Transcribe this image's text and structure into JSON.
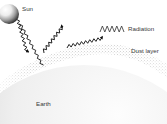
{
  "figure": {
    "background_color": "#ffffff",
    "width": 167,
    "height": 124
  },
  "labels": {
    "sun": "Sun",
    "radiation": "Radiation",
    "dust_layer": "Dust layer",
    "earth": "Earth"
  },
  "legend": {
    "symbol_name": "zigzag-wave-icon",
    "symbol_text": "WWWW",
    "entry_label": "Radiation"
  },
  "colors": {
    "text": "#3a3a3a",
    "ray": "#1a1a1a",
    "sun_light": "#f2f2f2",
    "sun_dark": "#2b2b2b",
    "earth_light": "#fbfbfb",
    "earth_dark": "#b9b9b9",
    "dust": "#9a9a9a"
  },
  "elements": {
    "sun": {
      "name": "sun-sphere",
      "cx": 9,
      "cy": 14,
      "r": 10
    },
    "earth": {
      "name": "earth-sphere",
      "cx": 84,
      "cy": 205,
      "r": 140
    },
    "dust_layer": {
      "name": "dust-layer-band",
      "description": "stippled arc band above earth"
    }
  },
  "rays": [
    {
      "name": "incoming-ray-1",
      "from": [
        16,
        20
      ],
      "to": [
        42,
        54
      ],
      "arrow": "end",
      "direction": "down-right"
    },
    {
      "name": "incoming-ray-2",
      "from": [
        20,
        27
      ],
      "to": [
        66,
        49
      ],
      "arrow": "none",
      "direction": "down-right"
    },
    {
      "name": "outgoing-ray-1",
      "from": [
        44,
        52
      ],
      "to": [
        59,
        9
      ],
      "arrow": "end",
      "direction": "up"
    },
    {
      "name": "outgoing-ray-2",
      "from": [
        67,
        48
      ],
      "to": [
        110,
        6
      ],
      "arrow": "end",
      "direction": "up-right"
    }
  ]
}
